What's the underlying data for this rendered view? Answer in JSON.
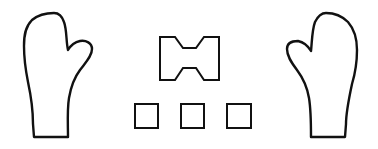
{
  "scene": {
    "description": "Line drawing of two mittens (left and right) flanking a bow-tie shape above three small squares",
    "background": "#ffffff",
    "stroke_color": "#111111"
  },
  "shapes": [
    {
      "name": "left-mitten",
      "type": "mitten",
      "orientation": "thumb-right"
    },
    {
      "name": "bow-tie",
      "type": "bow-tie"
    },
    {
      "name": "square-1",
      "type": "square"
    },
    {
      "name": "square-2",
      "type": "square"
    },
    {
      "name": "square-3",
      "type": "square"
    },
    {
      "name": "right-mitten",
      "type": "mitten",
      "orientation": "thumb-left"
    }
  ]
}
